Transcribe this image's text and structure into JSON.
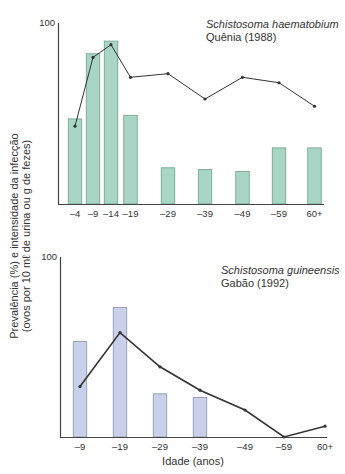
{
  "figure": {
    "y_axis_label_line1": "Prevalência (%) e intensidade da infecção",
    "y_axis_label_line2": "(ovos por 10 mℓ de urina ou g de fezes)",
    "x_axis_label": "Idade (anos)"
  },
  "chart_data": [
    {
      "type": "bar",
      "title": "Schistosoma haematobium",
      "subtitle": "Quênia (1988)",
      "xlabel": "Idade (anos)",
      "ylabel": "Prevalência (%) e intensidade da infecção (ovos por 10 mℓ de urina ou g de fezes)",
      "ylim": [
        0,
        100
      ],
      "y_ticks": [
        "100"
      ],
      "grid": false,
      "categories": [
        "–4",
        "–9",
        "–14",
        "–19",
        "–29",
        "–39",
        "–49",
        "–59",
        "60+"
      ],
      "series": [
        {
          "name": "Prevalência (%)",
          "kind": "bar",
          "color": "#a9d5c5",
          "border": "#6f9f8e",
          "values": [
            47,
            83,
            90,
            49,
            20,
            19,
            18,
            31,
            31
          ]
        },
        {
          "name": "Intensidade da infecção",
          "kind": "line",
          "color": "#333333",
          "values": [
            43,
            81,
            88,
            70,
            72,
            58,
            70,
            67,
            54
          ]
        }
      ]
    },
    {
      "type": "bar",
      "title": "Schistosoma guineensis",
      "subtitle": "Gabão (1992)",
      "xlabel": "Idade (anos)",
      "ylabel": "Prevalência (%) e intensidade da infecção (ovos por 10 mℓ de urina ou g de fezes)",
      "ylim": [
        0,
        100
      ],
      "y_ticks": [
        "100"
      ],
      "grid": false,
      "categories": [
        "–9",
        "–19",
        "–29",
        "–39",
        "–49",
        "–59",
        "60+"
      ],
      "series": [
        {
          "name": "Prevalência (%)",
          "kind": "bar",
          "color": "#c9d1ea",
          "border": "#8c93ab",
          "values": [
            53,
            72,
            24,
            22,
            null,
            null,
            null
          ]
        },
        {
          "name": "Intensidade da infecção",
          "kind": "line",
          "color": "#333333",
          "values": [
            28,
            58,
            39,
            26,
            15,
            0,
            6
          ]
        }
      ]
    }
  ]
}
